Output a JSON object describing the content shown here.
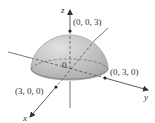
{
  "diagram": {
    "type": "3d-solid",
    "axes": {
      "x": "x",
      "y": "y",
      "z": "z"
    },
    "origin_label": "0",
    "points": [
      {
        "label": "(0, 0, 3)",
        "coords": [
          0,
          0,
          3
        ]
      },
      {
        "label": "(0, 3, 0)",
        "coords": [
          0,
          3,
          0
        ]
      },
      {
        "label": "(3, 0, 0)",
        "coords": [
          3,
          0,
          0
        ]
      }
    ],
    "colors": {
      "surface": "#b8b8b8",
      "surface_highlight": "#dedede",
      "axis": "#444444",
      "dashed": "#555555"
    }
  }
}
